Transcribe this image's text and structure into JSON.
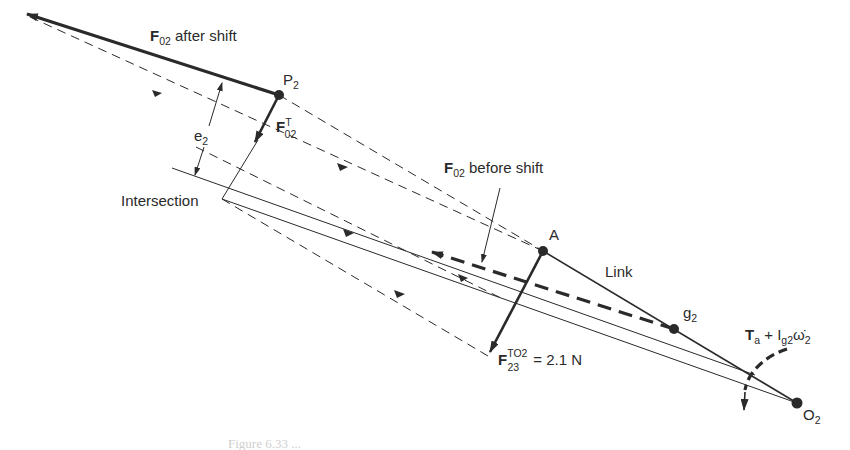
{
  "diagram": {
    "type": "force-analysis-link",
    "colors": {
      "ink": "#2a2a2a",
      "background": "#ffffff"
    },
    "points": {
      "P2": {
        "label": "P",
        "sub": "2",
        "x": 279,
        "y": 95
      },
      "A": {
        "label": "A",
        "x": 543,
        "y": 251
      },
      "g2": {
        "label": "g",
        "sub": "2",
        "x": 674,
        "y": 329
      },
      "O2": {
        "label": "O",
        "sub": "2",
        "x": 797,
        "y": 403
      },
      "intersection": {
        "label": "Intersection",
        "x": 222,
        "y": 199
      }
    },
    "labels": {
      "f02_after": {
        "main": "F",
        "sub": "02",
        "rest": " after shift"
      },
      "f02_before": {
        "main": "F",
        "sub": "02",
        "rest": " before shift"
      },
      "f02_t": {
        "main": "F",
        "sup": "T",
        "sub": "02"
      },
      "e2": {
        "main": "e",
        "sub": "2"
      },
      "link": "Link",
      "f23": {
        "main": "F",
        "sup": "TO2",
        "sub": "23",
        "rest": " = 2.1 N"
      },
      "torque": {
        "t": "T",
        "t_sub": "a",
        "plus": " + ",
        "i": "I",
        "i_sub": "g2",
        "omega": "ω̇",
        "omega_sub": "2"
      }
    },
    "caption": "Figure 6.33  ..."
  }
}
